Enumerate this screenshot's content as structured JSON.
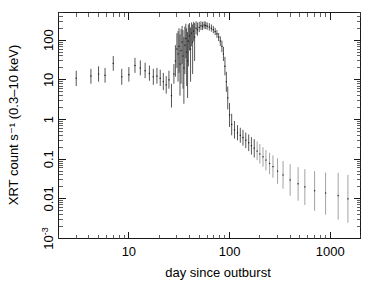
{
  "figure": {
    "kind": "x-ray-light-curve",
    "background_color": "#ffffff",
    "ink_color": "#1a1a1a"
  },
  "axes": {
    "x": {
      "title": "day since outburst",
      "scale": "log",
      "range": [
        2,
        2000
      ],
      "major_ticks": [
        10,
        100,
        1000
      ],
      "major_tick_labels": [
        "10",
        "100",
        "1000"
      ],
      "minor_ticks": [
        2,
        3,
        4,
        5,
        6,
        7,
        8,
        9,
        20,
        30,
        40,
        50,
        60,
        70,
        80,
        90,
        200,
        300,
        400,
        500,
        600,
        700,
        800,
        900,
        2000
      ]
    },
    "y": {
      "title": "XRT count s⁻¹ (0.3–10 keV)",
      "title_plain": "XRT count s-1 (0.3-10 keV)",
      "scale": "log",
      "range": [
        0.001,
        500
      ],
      "major_ticks": [
        100,
        10,
        1,
        0.1,
        0.01,
        0.001
      ],
      "major_tick_labels": [
        "100",
        "10",
        "1",
        "0.1",
        "0.01",
        "10⁻³"
      ],
      "decades": [
        -3,
        -2,
        -1,
        0,
        1,
        2
      ]
    }
  },
  "chart_data": {
    "type": "scatter",
    "title": "",
    "xlabel": "day since outburst",
    "ylabel": "XRT count s⁻¹ (0.3–10 keV)",
    "xscale": "log",
    "yscale": "log",
    "xlim": [
      2,
      2000
    ],
    "ylim": [
      0.001,
      500
    ],
    "grid": false,
    "legend": "none",
    "series": [
      {
        "name": "XRT count rate",
        "marker": "point-with-vertical-errorbar",
        "color": "#1a1a1a",
        "points": [
          {
            "x": 3.0,
            "y": 11.0,
            "yerr_lo": 7.0,
            "yerr_hi": 17.0
          },
          {
            "x": 4.2,
            "y": 12.5,
            "yerr_lo": 8.0,
            "yerr_hi": 19.0
          },
          {
            "x": 5.0,
            "y": 14.0,
            "yerr_lo": 9.0,
            "yerr_hi": 22.0
          },
          {
            "x": 5.8,
            "y": 13.0,
            "yerr_lo": 8.5,
            "yerr_hi": 20.0
          },
          {
            "x": 7.0,
            "y": 26.0,
            "yerr_lo": 17.0,
            "yerr_hi": 40.0
          },
          {
            "x": 8.5,
            "y": 12.0,
            "yerr_lo": 7.5,
            "yerr_hi": 19.0
          },
          {
            "x": 10.0,
            "y": 13.5,
            "yerr_lo": 9.0,
            "yerr_hi": 21.0
          },
          {
            "x": 11.5,
            "y": 23.0,
            "yerr_lo": 15.0,
            "yerr_hi": 36.0
          },
          {
            "x": 13.0,
            "y": 20.0,
            "yerr_lo": 13.0,
            "yerr_hi": 31.0
          },
          {
            "x": 14.5,
            "y": 17.0,
            "yerr_lo": 11.0,
            "yerr_hi": 27.0
          },
          {
            "x": 16.0,
            "y": 14.5,
            "yerr_lo": 9.5,
            "yerr_hi": 23.0
          },
          {
            "x": 17.5,
            "y": 12.0,
            "yerr_lo": 7.5,
            "yerr_hi": 19.0
          },
          {
            "x": 19.0,
            "y": 12.5,
            "yerr_lo": 8.0,
            "yerr_hi": 20.0
          },
          {
            "x": 20.5,
            "y": 11.0,
            "yerr_lo": 7.0,
            "yerr_hi": 18.0
          },
          {
            "x": 22.0,
            "y": 9.0,
            "yerr_lo": 5.5,
            "yerr_hi": 15.0
          },
          {
            "x": 23.5,
            "y": 7.5,
            "yerr_lo": 4.5,
            "yerr_hi": 12.5
          },
          {
            "x": 25.0,
            "y": 10.0,
            "yerr_lo": 6.0,
            "yerr_hi": 17.0
          },
          {
            "x": 26.5,
            "y": 4.0,
            "yerr_lo": 2.0,
            "yerr_hi": 8.0
          },
          {
            "x": 28.0,
            "y": 14.0,
            "yerr_lo": 8.0,
            "yerr_hi": 25.0
          },
          {
            "x": 29.0,
            "y": 30.0,
            "yerr_lo": 12.0,
            "yerr_hi": 75.0
          },
          {
            "x": 30.0,
            "y": 60.0,
            "yerr_lo": 20.0,
            "yerr_hi": 150.0
          },
          {
            "x": 30.8,
            "y": 45.0,
            "yerr_lo": 9.0,
            "yerr_hi": 170.0
          },
          {
            "x": 31.5,
            "y": 70.0,
            "yerr_lo": 15.0,
            "yerr_hi": 200.0
          },
          {
            "x": 32.2,
            "y": 25.0,
            "yerr_lo": 4.0,
            "yerr_hi": 140.0
          },
          {
            "x": 33.0,
            "y": 55.0,
            "yerr_lo": 8.0,
            "yerr_hi": 190.0
          },
          {
            "x": 33.8,
            "y": 90.0,
            "yerr_lo": 25.0,
            "yerr_hi": 230.0
          },
          {
            "x": 34.5,
            "y": 40.0,
            "yerr_lo": 6.0,
            "yerr_hi": 180.0
          },
          {
            "x": 35.2,
            "y": 20.0,
            "yerr_lo": 2.5,
            "yerr_hi": 120.0
          },
          {
            "x": 36.0,
            "y": 75.0,
            "yerr_lo": 14.0,
            "yerr_hi": 220.0
          },
          {
            "x": 36.8,
            "y": 110.0,
            "yerr_lo": 35.0,
            "yerr_hi": 260.0
          },
          {
            "x": 37.5,
            "y": 50.0,
            "yerr_lo": 7.0,
            "yerr_hi": 200.0
          },
          {
            "x": 38.3,
            "y": 30.0,
            "yerr_lo": 3.5,
            "yerr_hi": 160.0
          },
          {
            "x": 39.0,
            "y": 95.0,
            "yerr_lo": 22.0,
            "yerr_hi": 250.0
          },
          {
            "x": 40.0,
            "y": 130.0,
            "yerr_lo": 55.0,
            "yerr_hi": 270.0
          },
          {
            "x": 41.0,
            "y": 60.0,
            "yerr_lo": 9.0,
            "yerr_hi": 210.0
          },
          {
            "x": 42.0,
            "y": 150.0,
            "yerr_lo": 70.0,
            "yerr_hi": 280.0
          },
          {
            "x": 43.0,
            "y": 90.0,
            "yerr_lo": 14.0,
            "yerr_hi": 250.0
          },
          {
            "x": 44.0,
            "y": 170.0,
            "yerr_lo": 95.0,
            "yerr_hi": 290.0
          },
          {
            "x": 45.0,
            "y": 120.0,
            "yerr_lo": 30.0,
            "yerr_hi": 270.0
          },
          {
            "x": 46.5,
            "y": 200.0,
            "yerr_lo": 140.0,
            "yerr_hi": 300.0
          },
          {
            "x": 48.0,
            "y": 185.0,
            "yerr_lo": 130.0,
            "yerr_hi": 280.0
          },
          {
            "x": 50.0,
            "y": 210.0,
            "yerr_lo": 160.0,
            "yerr_hi": 290.0
          },
          {
            "x": 52.0,
            "y": 230.0,
            "yerr_lo": 180.0,
            "yerr_hi": 300.0
          },
          {
            "x": 54.0,
            "y": 225.0,
            "yerr_lo": 180.0,
            "yerr_hi": 290.0
          },
          {
            "x": 56.0,
            "y": 240.0,
            "yerr_lo": 195.0,
            "yerr_hi": 300.0
          },
          {
            "x": 58.0,
            "y": 235.0,
            "yerr_lo": 190.0,
            "yerr_hi": 295.0
          },
          {
            "x": 60.0,
            "y": 225.0,
            "yerr_lo": 185.0,
            "yerr_hi": 280.0
          },
          {
            "x": 63.0,
            "y": 215.0,
            "yerr_lo": 175.0,
            "yerr_hi": 270.0
          },
          {
            "x": 66.0,
            "y": 200.0,
            "yerr_lo": 165.0,
            "yerr_hi": 250.0
          },
          {
            "x": 69.0,
            "y": 185.0,
            "yerr_lo": 150.0,
            "yerr_hi": 230.0
          },
          {
            "x": 72.0,
            "y": 165.0,
            "yerr_lo": 135.0,
            "yerr_hi": 205.0
          },
          {
            "x": 75.0,
            "y": 145.0,
            "yerr_lo": 115.0,
            "yerr_hi": 180.0
          },
          {
            "x": 78.0,
            "y": 120.0,
            "yerr_lo": 95.0,
            "yerr_hi": 152.0
          },
          {
            "x": 81.0,
            "y": 95.0,
            "yerr_lo": 72.0,
            "yerr_hi": 125.0
          },
          {
            "x": 84.0,
            "y": 70.0,
            "yerr_lo": 50.0,
            "yerr_hi": 98.0
          },
          {
            "x": 87.0,
            "y": 45.0,
            "yerr_lo": 30.0,
            "yerr_hi": 68.0
          },
          {
            "x": 90.0,
            "y": 22.0,
            "yerr_lo": 13.0,
            "yerr_hi": 38.0
          },
          {
            "x": 93.0,
            "y": 9.0,
            "yerr_lo": 5.0,
            "yerr_hi": 16.0
          },
          {
            "x": 96.0,
            "y": 3.5,
            "yerr_lo": 1.8,
            "yerr_hi": 6.8
          },
          {
            "x": 100.0,
            "y": 1.3,
            "yerr_lo": 0.65,
            "yerr_hi": 2.6
          },
          {
            "x": 105.0,
            "y": 0.75,
            "yerr_lo": 0.4,
            "yerr_hi": 1.4
          },
          {
            "x": 112.0,
            "y": 0.55,
            "yerr_lo": 0.33,
            "yerr_hi": 0.92
          },
          {
            "x": 120.0,
            "y": 0.46,
            "yerr_lo": 0.3,
            "yerr_hi": 0.72
          },
          {
            "x": 128.0,
            "y": 0.4,
            "yerr_lo": 0.26,
            "yerr_hi": 0.62
          },
          {
            "x": 136.0,
            "y": 0.35,
            "yerr_lo": 0.22,
            "yerr_hi": 0.55
          },
          {
            "x": 145.0,
            "y": 0.3,
            "yerr_lo": 0.19,
            "yerr_hi": 0.47
          },
          {
            "x": 155.0,
            "y": 0.26,
            "yerr_lo": 0.16,
            "yerr_hi": 0.42
          },
          {
            "x": 165.0,
            "y": 0.22,
            "yerr_lo": 0.13,
            "yerr_hi": 0.36
          },
          {
            "x": 176.0,
            "y": 0.19,
            "yerr_lo": 0.11,
            "yerr_hi": 0.32
          },
          {
            "x": 188.0,
            "y": 0.16,
            "yerr_lo": 0.095,
            "yerr_hi": 0.28
          },
          {
            "x": 200.0,
            "y": 0.135,
            "yerr_lo": 0.078,
            "yerr_hi": 0.24
          },
          {
            "x": 215.0,
            "y": 0.115,
            "yerr_lo": 0.065,
            "yerr_hi": 0.2
          },
          {
            "x": 230.0,
            "y": 0.095,
            "yerr_lo": 0.052,
            "yerr_hi": 0.17
          },
          {
            "x": 250.0,
            "y": 0.078,
            "yerr_lo": 0.042,
            "yerr_hi": 0.145
          },
          {
            "x": 270.0,
            "y": 0.065,
            "yerr_lo": 0.034,
            "yerr_hi": 0.125
          },
          {
            "x": 300.0,
            "y": 0.05,
            "yerr_lo": 0.024,
            "yerr_hi": 0.105
          },
          {
            "x": 340.0,
            "y": 0.04,
            "yerr_lo": 0.018,
            "yerr_hi": 0.09
          },
          {
            "x": 400.0,
            "y": 0.03,
            "yerr_lo": 0.012,
            "yerr_hi": 0.075
          },
          {
            "x": 480.0,
            "y": 0.024,
            "yerr_lo": 0.009,
            "yerr_hi": 0.063
          },
          {
            "x": 560.0,
            "y": 0.02,
            "yerr_lo": 0.007,
            "yerr_hi": 0.056
          },
          {
            "x": 700.0,
            "y": 0.016,
            "yerr_lo": 0.005,
            "yerr_hi": 0.05
          },
          {
            "x": 900.0,
            "y": 0.014,
            "yerr_lo": 0.004,
            "yerr_hi": 0.046
          },
          {
            "x": 1200.0,
            "y": 0.012,
            "yerr_lo": 0.003,
            "yerr_hi": 0.045
          },
          {
            "x": 1500.0,
            "y": 0.01,
            "yerr_lo": 0.0025,
            "yerr_hi": 0.04
          }
        ]
      }
    ]
  }
}
